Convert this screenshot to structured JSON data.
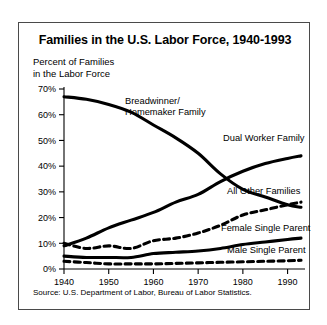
{
  "chart_data": {
    "type": "line",
    "title": "Families in the U.S. Labor Force, 1940-1993",
    "ylabel_line1": "Percent of Families",
    "ylabel_line2": "in the Labor Force",
    "xlabel": "",
    "source": "Source: U.S. Department of Labor, Bureau of Labor Statistics.",
    "xlim": [
      1940,
      1993
    ],
    "ylim": [
      0,
      70
    ],
    "grid": false,
    "legend_position": "inline-annotations",
    "x_ticks": [
      1940,
      1950,
      1960,
      1970,
      1980,
      1990
    ],
    "x_tick_labels": [
      "1940",
      "1950",
      "1960",
      "1970",
      "1980",
      "1990"
    ],
    "y_ticks": [
      0,
      10,
      20,
      30,
      40,
      50,
      60,
      70
    ],
    "y_tick_labels": [
      "0%",
      "10%",
      "20%",
      "30%",
      "40%",
      "50%",
      "60%",
      "70%"
    ],
    "x": [
      1940,
      1945,
      1950,
      1955,
      1960,
      1965,
      1970,
      1975,
      1980,
      1985,
      1990,
      1993
    ],
    "series": [
      {
        "name": "Breadwinner/Homemaker Family",
        "label_line1": "Breadwinner/",
        "label_line2": "Homemaker Family",
        "style": "solid",
        "color": "#000000",
        "values": [
          67,
          66,
          64,
          61,
          56,
          51,
          45,
          37,
          31,
          28,
          25,
          24
        ]
      },
      {
        "name": "Dual Worker Family",
        "label_line1": "Dual Worker Family",
        "label_line2": "",
        "style": "solid",
        "color": "#000000",
        "values": [
          9,
          12,
          16,
          19,
          22,
          26,
          29,
          34,
          38,
          41,
          43,
          44
        ]
      },
      {
        "name": "All Other Families",
        "label_line1": "All Other Families",
        "label_line2": "",
        "style": "dashed",
        "color": "#000000",
        "values": [
          10,
          8,
          9,
          8,
          11,
          12,
          14,
          17,
          21,
          23,
          25,
          26
        ]
      },
      {
        "name": "Female Single Parent",
        "label_line1": "Female Single Parent",
        "label_line2": "",
        "style": "solid",
        "color": "#000000",
        "values": [
          5,
          4.5,
          4.5,
          4.5,
          6,
          6.5,
          7,
          8,
          9.5,
          10.5,
          11.5,
          12
        ]
      },
      {
        "name": "Male Single Parent",
        "label_line1": "Male Single Parent",
        "label_line2": "",
        "style": "dashed",
        "color": "#000000",
        "values": [
          3,
          2.5,
          2,
          2,
          2,
          2.2,
          2.4,
          2.6,
          2.8,
          3,
          3.2,
          3.4
        ]
      }
    ],
    "annotations": [
      {
        "text": "Breadwinner/Homemaker Family",
        "x_px": 106,
        "y_px": 73
      },
      {
        "text": "Dual Worker Family",
        "x_px": 204,
        "y_px": 110
      },
      {
        "text": "All Other Families",
        "x_px": 208,
        "y_px": 163
      },
      {
        "text": "Female Single Parent",
        "x_px": 202,
        "y_px": 200
      },
      {
        "text": "Male Single Parent",
        "x_px": 208,
        "y_px": 222
      }
    ]
  }
}
